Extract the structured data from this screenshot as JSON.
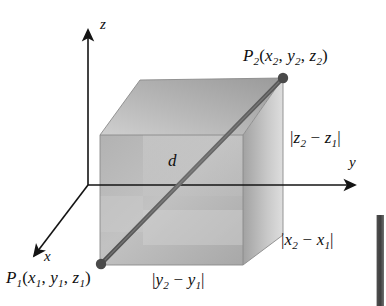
{
  "figure": {
    "axes": [
      {
        "name": "z-axis",
        "label": "z"
      },
      {
        "name": "y-axis",
        "label": "y"
      },
      {
        "name": "x-axis",
        "label": "x"
      }
    ],
    "points": [
      {
        "name": "P2",
        "label_parts": {
          "p": "P",
          "psub": "2",
          "open": "(",
          "x": "x",
          "xsub": "2",
          "c1": ", ",
          "y": "y",
          "ysub": "2",
          "c2": ", ",
          "z": "z",
          "zsub": "2",
          "close": ")"
        }
      },
      {
        "name": "P1",
        "label_parts": {
          "p": "P",
          "psub": "1",
          "open": "(",
          "x": "x",
          "xsub": "1",
          "c1": ", ",
          "y": "y",
          "ysub": "1",
          "c2": ", ",
          "z": "z",
          "zsub": "1",
          "close": ")"
        }
      }
    ],
    "diagonal": {
      "label": "d"
    },
    "edge_lengths": [
      {
        "name": "dz",
        "parts": {
          "bar1": "|",
          "v": "z",
          "sub2": "2",
          "minus": " − ",
          "v1": "z",
          "sub1": "1",
          "bar2": "|"
        }
      },
      {
        "name": "dx",
        "parts": {
          "bar1": "|",
          "v": "x",
          "sub2": "2",
          "minus": " − ",
          "v1": "x",
          "sub1": "1",
          "bar2": "|"
        }
      },
      {
        "name": "dy",
        "parts": {
          "bar1": "|",
          "v": "y",
          "sub2": "2",
          "minus": " − ",
          "v1": "y",
          "sub1": "1",
          "bar2": "|"
        }
      }
    ],
    "colors": {
      "ink": "#101010",
      "axis": "#1b1b1b",
      "box_light": "#dcdcdc",
      "box_mid": "#b4b4b4",
      "box_dark": "#8e8e8e",
      "diagonal": "#5a5a5a",
      "page_edge": "#3e3e3e",
      "background": "#ffffff"
    }
  }
}
